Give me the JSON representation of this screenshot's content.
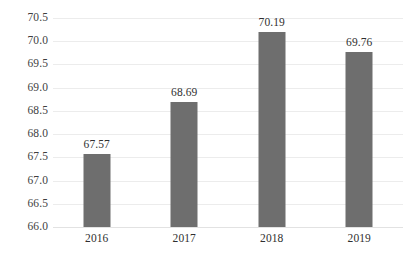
{
  "chart_data": {
    "type": "bar",
    "title": "",
    "subtitle": "",
    "xlabel": "",
    "ylabel": "",
    "categories": [
      "2016",
      "2017",
      "2018",
      "2019"
    ],
    "values": [
      67.57,
      68.69,
      70.19,
      69.76
    ],
    "data_labels": [
      "67.57",
      "68.69",
      "70.19",
      "69.76"
    ],
    "ylim": [
      66.0,
      70.5
    ],
    "ytick_step": 0.5,
    "ytick_labels": [
      "70.5",
      "70.0",
      "69.5",
      "69.0",
      "68.5",
      "68.0",
      "67.5",
      "67.0",
      "66.5",
      "66.0"
    ],
    "ytick_values": [
      70.5,
      70.0,
      69.5,
      69.0,
      68.5,
      68.0,
      67.5,
      67.0,
      66.5,
      66.0
    ],
    "grid": true,
    "grid_axis": "y",
    "legend": false,
    "legend_position": "none",
    "series": [
      {
        "name": "",
        "values": [
          67.57,
          68.69,
          70.19,
          69.76
        ],
        "color": "#6e6e6e"
      }
    ],
    "colors": {
      "bar": "#6e6e6e",
      "gridline": "#ececec",
      "baseline": "#e2e2e2",
      "tick_label": "#3f3f3f",
      "data_label": "#2f2f2f",
      "background": "#ffffff"
    }
  }
}
